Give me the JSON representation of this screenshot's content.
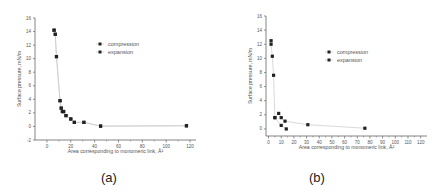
{
  "chart_data": [
    {
      "id": "a",
      "type": "scatter",
      "caption": "(a)",
      "xlabel": "Area corresponding to monomeric link, Å²",
      "ylabel": "Surface pressure, mN/m",
      "xlim": [
        -10,
        125
      ],
      "ylim": [
        -2,
        16
      ],
      "xticks": [
        0,
        20,
        40,
        60,
        80,
        100,
        120
      ],
      "yticks": [
        -2,
        0,
        2,
        4,
        6,
        8,
        10,
        12,
        14,
        16
      ],
      "grid": false,
      "legend_position": "top-right",
      "series": [
        {
          "name": "compression",
          "x": [
            6,
            7,
            8,
            11,
            12,
            13,
            14,
            16,
            20,
            23,
            31,
            45,
            117
          ],
          "y": [
            14.2,
            13.6,
            10.3,
            3.8,
            2.7,
            2.2,
            2.2,
            1.6,
            1.1,
            0.6,
            0.6,
            0.05,
            0.1
          ]
        },
        {
          "name": "expansion",
          "x": [
            6,
            7,
            8,
            11,
            12,
            13,
            14,
            16,
            20,
            23,
            31,
            45,
            117
          ],
          "y": [
            14.2,
            13.6,
            10.3,
            3.8,
            2.7,
            2.2,
            2.2,
            1.6,
            1.1,
            0.6,
            0.6,
            0.05,
            0.1
          ]
        }
      ]
    },
    {
      "id": "b",
      "type": "scatter",
      "caption": "(b)",
      "xlabel": "Area corresponding to monomeric link, Å²",
      "ylabel": "Surface pressure, mN/m",
      "xlim": [
        -2,
        125
      ],
      "ylim": [
        -1,
        16
      ],
      "xticks": [
        0,
        10,
        20,
        30,
        40,
        50,
        60,
        70,
        80,
        90,
        100,
        110,
        120
      ],
      "yticks": [
        0,
        2,
        4,
        6,
        8,
        10,
        12,
        14,
        16
      ],
      "grid": false,
      "legend_position": "top-right",
      "series": [
        {
          "name": "compression",
          "x": [
            2,
            2,
            3,
            4,
            5,
            8,
            10,
            13,
            31,
            76
          ],
          "y": [
            12.5,
            12.0,
            10.3,
            7.6,
            1.6,
            2.2,
            1.6,
            1.1,
            0.6,
            0.1
          ]
        },
        {
          "name": "expansion",
          "x": [
            5,
            10,
            14
          ],
          "y": [
            1.6,
            0.5,
            0.0
          ]
        }
      ]
    }
  ]
}
